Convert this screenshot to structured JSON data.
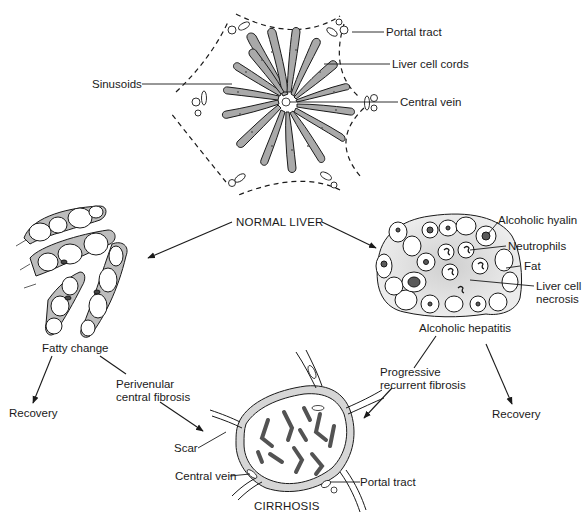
{
  "figure": {
    "type": "flow-diagram",
    "nodes": {
      "normal_liver": {
        "title": "NORMAL LIVER",
        "labels": {
          "portal_tract": "Portal tract",
          "liver_cell_cords": "Liver cell cords",
          "sinusoids": "Sinusoids",
          "central_vein": "Central vein"
        }
      },
      "fatty_change": {
        "title": "Fatty change"
      },
      "alcoholic_hepatitis": {
        "title": "Alcoholic hepatitis",
        "labels": {
          "alcoholic_hyalin": "Alcoholic hyalin",
          "neutrophils": "Neutrophils",
          "fat": "Fat",
          "liver_cell_necrosis_1": "Liver cell",
          "liver_cell_necrosis_2": "necrosis"
        }
      },
      "cirrhosis": {
        "title": "CIRRHOSIS",
        "labels": {
          "scar": "Scar",
          "central_vein": "Central vein",
          "portal_tract": "Portal tract"
        }
      },
      "recovery_left": {
        "title": "Recovery"
      },
      "recovery_right": {
        "title": "Recovery"
      }
    },
    "edges": {
      "perivenular_1": "Perivenular",
      "perivenular_2": "central fibrosis",
      "progressive_1": "Progressive",
      "progressive_2": "recurrent fibrosis"
    }
  }
}
